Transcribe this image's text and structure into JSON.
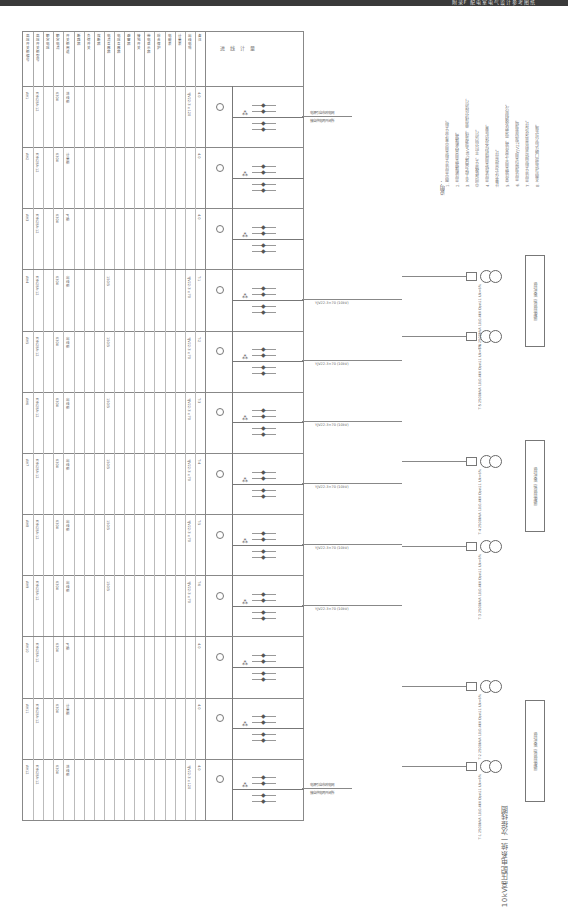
{
  "header_bar": {
    "title": "附录F  配电室电气设计参考图纸"
  },
  "drawing": {
    "title": "10kV高压配电系统一次接线图",
    "orientation": "rotated 90deg",
    "table_header_rows": [
      "高压开关柜编号",
      "高压开关柜型号",
      "额定电压",
      "额定电流",
      "开关柜用途",
      "断路器",
      "负荷开关",
      "熔断器",
      "电流互感器",
      "电压互感器",
      "避雷器",
      "接地开关",
      "带电显示器",
      "综合保护",
      "电能表",
      "计量表",
      "出线电缆",
      "备注"
    ],
    "cabinets": [
      {
        "id": "AH1",
        "model": "KYN28A-12",
        "rating": "630A",
        "use": "进线柜",
        "ct": "",
        "cable": "YJV22-3×120",
        "remark": "4.0"
      },
      {
        "id": "AH2",
        "model": "KYN28A-12",
        "rating": "630A",
        "use": "计量柜",
        "ct": "",
        "cable": "",
        "remark": "4.0"
      },
      {
        "id": "AH3",
        "model": "KYN28A-12",
        "rating": "630A",
        "use": "PT柜",
        "ct": "",
        "cable": "",
        "remark": "4.0"
      },
      {
        "id": "AH4",
        "model": "KYN28A-12",
        "rating": "630A",
        "use": "出线柜",
        "ct": "150/5",
        "cable": "YJV22-3×70",
        "remark": "T-1"
      },
      {
        "id": "AH5",
        "model": "KYN28A-12",
        "rating": "630A",
        "use": "出线柜",
        "ct": "150/5",
        "cable": "YJV22-3×70",
        "remark": "T-2"
      },
      {
        "id": "AH6",
        "model": "KYN28A-12",
        "rating": "630A",
        "use": "出线柜",
        "ct": "150/5",
        "cable": "YJV22-3×70",
        "remark": "T-3"
      },
      {
        "id": "AH7",
        "model": "KYN28A-12",
        "rating": "630A",
        "use": "出线柜",
        "ct": "150/5",
        "cable": "YJV22-3×70",
        "remark": "T-4"
      },
      {
        "id": "AH8",
        "model": "KYN28A-12",
        "rating": "630A",
        "use": "出线柜",
        "ct": "150/5",
        "cable": "YJV22-3×70",
        "remark": "T-5"
      },
      {
        "id": "AH9",
        "model": "KYN28A-12",
        "rating": "630A",
        "use": "出线柜",
        "ct": "150/5",
        "cable": "YJV22-3×70",
        "remark": "T-6"
      },
      {
        "id": "AH10",
        "model": "KYN28A-12",
        "rating": "630A",
        "use": "PT柜",
        "ct": "",
        "cable": "",
        "remark": "4.0"
      },
      {
        "id": "AH11",
        "model": "KYN28A-12",
        "rating": "630A",
        "use": "计量柜",
        "ct": "",
        "cable": "",
        "remark": "4.0"
      },
      {
        "id": "AH12",
        "model": "KYN28A-12",
        "rating": "630A",
        "use": "进线柜",
        "ct": "",
        "cable": "YJV22-3×120",
        "remark": "4.0"
      }
    ],
    "outgoing_label": "YJV22-3×70 (10kV)",
    "incoming_labels": [
      "电源引自市政电网",
      "接自供电局开闭所"
    ],
    "transformers": [
      {
        "id": "T-1",
        "capacity": "2500kVA",
        "voltage": "10/0.4kV",
        "connection": "Dyn11",
        "uk": "Uk=6%"
      },
      {
        "id": "T-2",
        "capacity": "2500kVA",
        "voltage": "10/0.4kV",
        "connection": "Dyn11",
        "uk": "Uk=6%"
      },
      {
        "id": "T-3",
        "capacity": "2500kVA",
        "voltage": "10/0.4kV",
        "connection": "Dyn11",
        "uk": "Uk=6%"
      },
      {
        "id": "T-4",
        "capacity": "2500kVA",
        "voltage": "10/0.4kV",
        "connection": "Dyn11",
        "uk": "Uk=6%"
      },
      {
        "id": "T-5",
        "capacity": "2500kVA",
        "voltage": "10/0.4kV",
        "connection": "Dyn11",
        "uk": "Uk=6%"
      },
      {
        "id": "T-6",
        "capacity": "2500kVA",
        "voltage": "10/0.4kV",
        "connection": "Dyn11",
        "uk": "Uk=6%"
      }
    ],
    "lv_panels": [
      "低压开关柜 详见低压系统图",
      "低压开关柜 详见低压系统图",
      "低压开关柜 详见低压系统图"
    ],
    "left_block_labels": [
      "进",
      "线",
      "计",
      "量",
      "一",
      "次"
    ],
    "notes": {
      "title": "说明：",
      "items": [
        "1. 图中高压开关柜采用中置式开关柜。",
        "2. 高压断路器采用真空断路器。",
        "3. 本工程为两路10kV电源进线，单母线分段运行，",
        "   中间设联络开关，平时分列运行。",
        "4. 高压系统采用微机综合保护装置，",
        "   计量方式为高供高计。",
        "5. 变压器采用干式变压器，带温控及强制风冷。",
        "6. 高压电缆均采用YJV22型铠装电缆。",
        "7. 高压开关柜由供货商负责深化设计。",
        "8. 本图与供电部门确认后方可实施。"
      ]
    }
  }
}
